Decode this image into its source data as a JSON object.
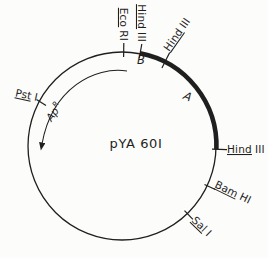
{
  "figure": {
    "background": "#fcfcfa",
    "ink_color": "#1f1f1f",
    "plasmid": {
      "name": "pYA 60I",
      "marker_gene": {
        "base": "Ap",
        "superscript": "R"
      },
      "regions": [
        {
          "label": "B"
        },
        {
          "label": "A"
        }
      ],
      "sites": [
        {
          "name": "Eco RI",
          "enzyme": "Eco",
          "suffix": "RI"
        },
        {
          "name": "Hind III",
          "enzyme": "Hind",
          "suffix": "III"
        },
        {
          "name": "Hind III",
          "enzyme": "Hind",
          "suffix": "III"
        },
        {
          "name": "Hind III",
          "enzyme": "Hind",
          "suffix": "III"
        },
        {
          "name": "Bam HI",
          "enzyme": "Bam",
          "suffix": "HI"
        },
        {
          "name": "Sal I",
          "enzyme": "Sal",
          "suffix": "I"
        },
        {
          "name": "Pst I",
          "enzyme": "Pst",
          "suffix": "I"
        }
      ]
    }
  }
}
